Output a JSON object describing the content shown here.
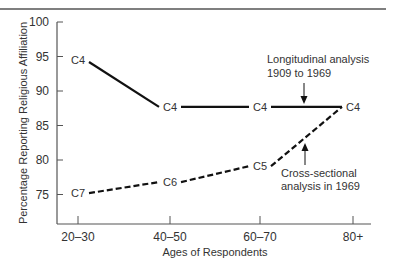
{
  "chart_data": {
    "type": "line",
    "title": "",
    "xlabel": "Ages of Respondents",
    "ylabel": "Percentage Reporting Religious Affiliation",
    "categories": [
      "20–30",
      "40–50",
      "60–70",
      "80+"
    ],
    "yticks": [
      75,
      80,
      85,
      90,
      95,
      100
    ],
    "ylim": [
      71,
      100
    ],
    "grid": false,
    "legend": "none (inline annotations)",
    "series": [
      {
        "name": "Longitudinal analysis 1909 to 1969",
        "style": "solid",
        "x": [
          "20–30",
          "40–50",
          "60–70",
          "80+"
        ],
        "values": [
          94.5,
          87.7,
          87.7,
          87.7
        ],
        "point_labels": [
          "C4",
          "C4",
          "C4",
          "C4"
        ]
      },
      {
        "name": "Cross-sectional analysis in 1969",
        "style": "dashed",
        "x": [
          "20–30",
          "40–50",
          "60–70",
          "80+"
        ],
        "values": [
          75.2,
          76.8,
          79.1,
          87.7
        ],
        "point_labels": [
          "C7",
          "C6",
          "C5",
          "C4"
        ]
      }
    ],
    "annotations": [
      {
        "lines": [
          "Longitudinal analysis",
          "1909 to 1969"
        ],
        "points_to": "solid line between 60–70 and 80+"
      },
      {
        "lines": [
          "Cross-sectional",
          "analysis in 1969"
        ],
        "points_to": "dashed line between 60–70 and 80+"
      }
    ]
  }
}
